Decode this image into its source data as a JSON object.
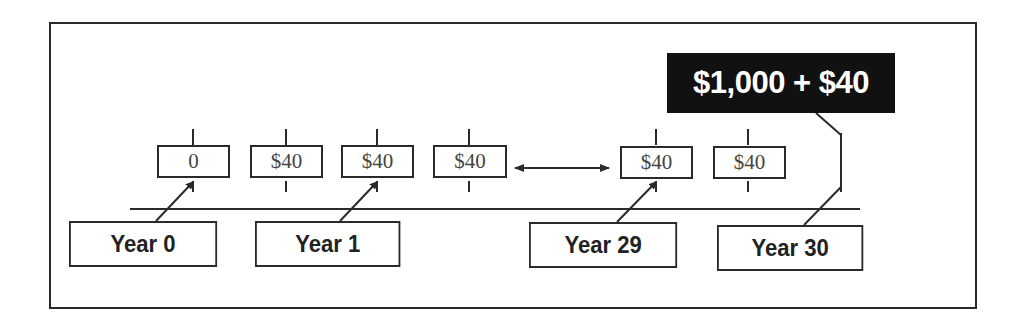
{
  "diagram": {
    "cash_flows": [
      {
        "label": "0"
      },
      {
        "label": "$40"
      },
      {
        "label": "$40"
      },
      {
        "label": "$40"
      },
      {
        "label": "$40"
      },
      {
        "label": "$40"
      }
    ],
    "years": [
      {
        "label": "Year 0"
      },
      {
        "label": "Year 1"
      },
      {
        "label": "Year 29"
      },
      {
        "label": "Year 30"
      }
    ],
    "final_payment": {
      "label": "$1,000 + $40"
    },
    "colors": {
      "line": "#2a2a2a",
      "final_bg": "#111111",
      "final_text": "#ffffff"
    }
  }
}
